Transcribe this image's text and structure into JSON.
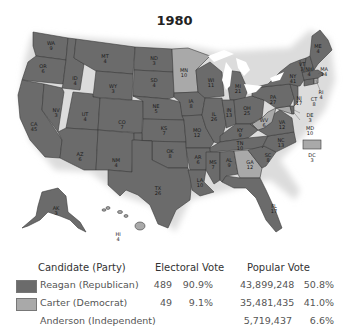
{
  "title": "1980",
  "colors": {
    "republican": "#6b6b6b",
    "democrat": "#a9a9a9",
    "border": "#3a3a3a",
    "lakes": "#ffffff"
  },
  "states": [
    {
      "abbr": "WA",
      "ev": "9",
      "party": "R"
    },
    {
      "abbr": "OR",
      "ev": "6",
      "party": "R"
    },
    {
      "abbr": "CA",
      "ev": "45",
      "party": "R"
    },
    {
      "abbr": "ID",
      "ev": "4",
      "party": "R"
    },
    {
      "abbr": "NV",
      "ev": "3",
      "party": "R"
    },
    {
      "abbr": "MT",
      "ev": "4",
      "party": "R"
    },
    {
      "abbr": "WY",
      "ev": "3",
      "party": "R"
    },
    {
      "abbr": "UT",
      "ev": "4",
      "party": "R"
    },
    {
      "abbr": "AZ",
      "ev": "6",
      "party": "R"
    },
    {
      "abbr": "CO",
      "ev": "7",
      "party": "R"
    },
    {
      "abbr": "NM",
      "ev": "4",
      "party": "R"
    },
    {
      "abbr": "ND",
      "ev": "3",
      "party": "R"
    },
    {
      "abbr": "SD",
      "ev": "4",
      "party": "R"
    },
    {
      "abbr": "NE",
      "ev": "5",
      "party": "R"
    },
    {
      "abbr": "KS",
      "ev": "7",
      "party": "R"
    },
    {
      "abbr": "OK",
      "ev": "8",
      "party": "R"
    },
    {
      "abbr": "TX",
      "ev": "26",
      "party": "R"
    },
    {
      "abbr": "MN",
      "ev": "10",
      "party": "D"
    },
    {
      "abbr": "IA",
      "ev": "8",
      "party": "R"
    },
    {
      "abbr": "MO",
      "ev": "12",
      "party": "R"
    },
    {
      "abbr": "AR",
      "ev": "6",
      "party": "R"
    },
    {
      "abbr": "LA",
      "ev": "10",
      "party": "R"
    },
    {
      "abbr": "WI",
      "ev": "11",
      "party": "R"
    },
    {
      "abbr": "IL",
      "ev": "26",
      "party": "R"
    },
    {
      "abbr": "MI",
      "ev": "21",
      "party": "R"
    },
    {
      "abbr": "IN",
      "ev": "13",
      "party": "R"
    },
    {
      "abbr": "OH",
      "ev": "25",
      "party": "R"
    },
    {
      "abbr": "KY",
      "ev": "9",
      "party": "R"
    },
    {
      "abbr": "TN",
      "ev": "10",
      "party": "R"
    },
    {
      "abbr": "MS",
      "ev": "7",
      "party": "R"
    },
    {
      "abbr": "AL",
      "ev": "9",
      "party": "R"
    },
    {
      "abbr": "GA",
      "ev": "12",
      "party": "D"
    },
    {
      "abbr": "FL",
      "ev": "17",
      "party": "R"
    },
    {
      "abbr": "SC",
      "ev": "8",
      "party": "R"
    },
    {
      "abbr": "NC",
      "ev": "13",
      "party": "R"
    },
    {
      "abbr": "VA",
      "ev": "12",
      "party": "R"
    },
    {
      "abbr": "WV",
      "ev": "6",
      "party": "D"
    },
    {
      "abbr": "MD",
      "ev": "10",
      "party": "D"
    },
    {
      "abbr": "DE",
      "ev": "3",
      "party": "R"
    },
    {
      "abbr": "PA",
      "ev": "27",
      "party": "R"
    },
    {
      "abbr": "NJ",
      "ev": "17",
      "party": "R"
    },
    {
      "abbr": "NY",
      "ev": "41",
      "party": "R"
    },
    {
      "abbr": "CT",
      "ev": "8",
      "party": "R"
    },
    {
      "abbr": "RI",
      "ev": "4",
      "party": "D"
    },
    {
      "abbr": "MA",
      "ev": "14",
      "party": "R"
    },
    {
      "abbr": "VT",
      "ev": "3",
      "party": "R"
    },
    {
      "abbr": "NH",
      "ev": "4",
      "party": "R"
    },
    {
      "abbr": "ME",
      "ev": "4",
      "party": "R"
    },
    {
      "abbr": "AK",
      "ev": "3",
      "party": "R"
    },
    {
      "abbr": "HI",
      "ev": "4",
      "party": "D"
    },
    {
      "abbr": "DC",
      "ev": "3",
      "party": "D"
    }
  ],
  "legend": {
    "headers": {
      "candidate": "Candidate (Party)",
      "electoral": "Electoral Vote",
      "popular": "Popular Vote"
    },
    "rows": [
      {
        "candidate": "Reagan (Republican)",
        "ev": "489",
        "ev_pct": "90.9%",
        "pv": "43,899,248",
        "pv_pct": "50.8%"
      },
      {
        "candidate": "Carter (Democrat)",
        "ev": "49",
        "ev_pct": "9.1%",
        "pv": "35,481,435",
        "pv_pct": "41.0%"
      },
      {
        "candidate": "Anderson (Independent)",
        "ev": "",
        "ev_pct": "",
        "pv": "5,719,437",
        "pv_pct": "6.6%"
      }
    ]
  }
}
